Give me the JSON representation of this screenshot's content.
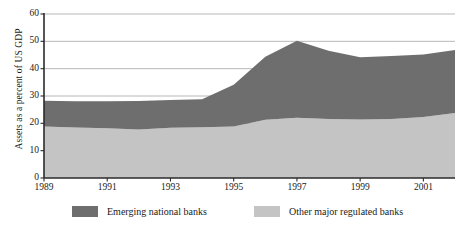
{
  "chart_data": {
    "type": "area",
    "title": "",
    "xlabel": "",
    "ylabel": "Assets as a percent of US GDP",
    "stacked": true,
    "grid": true,
    "legend_position": "bottom",
    "xlim": [
      1989,
      2002
    ],
    "ylim": [
      0,
      60
    ],
    "ytick_values": [
      0,
      10,
      20,
      30,
      40,
      50,
      60
    ],
    "ytick_labels": [
      "0",
      "10",
      "20",
      "30",
      "40",
      "50",
      "60"
    ],
    "xtick_values": [
      1989,
      1991,
      1993,
      1995,
      1997,
      1999,
      2001
    ],
    "xtick_labels": [
      "1989",
      "1991",
      "1993",
      "1995",
      "1997",
      "1999",
      "2001"
    ],
    "x": [
      1989,
      1990,
      1991,
      1992,
      1993,
      1994,
      1995,
      1996,
      1997,
      1998,
      1999,
      2000,
      2001,
      2002
    ],
    "series": [
      {
        "name": "Other major regulated banks",
        "color": "#c4c4c4",
        "values": [
          18.8,
          18.5,
          18.2,
          17.7,
          18.4,
          18.6,
          18.8,
          21.3,
          22.0,
          21.6,
          21.4,
          21.6,
          22.3,
          23.8
        ]
      },
      {
        "name": "Emerging national banks",
        "color": "#6e6e6e",
        "values": [
          9.5,
          9.6,
          9.9,
          10.5,
          10.1,
          10.2,
          15.3,
          23.1,
          28.2,
          25.0,
          22.8,
          23.0,
          22.9,
          23.0
        ]
      }
    ],
    "totals": [
      28.3,
      28.1,
      28.1,
      28.2,
      28.5,
      28.8,
      34.1,
      44.4,
      50.2,
      46.6,
      44.2,
      44.6,
      45.2,
      46.8
    ]
  },
  "legend": {
    "entries": [
      {
        "label": "Emerging national banks",
        "color": "#6e6e6e"
      },
      {
        "label": "Other major regulated banks",
        "color": "#c4c4c4"
      }
    ]
  },
  "axis": {
    "y_title": "Assets as a percent of US GDP"
  }
}
